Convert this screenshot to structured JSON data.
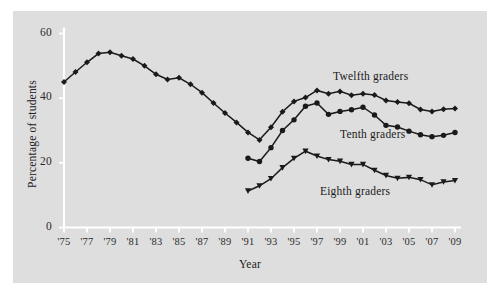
{
  "chart_data": {
    "type": "line",
    "title": "",
    "xlabel": "Year",
    "ylabel": "Percentage of students",
    "xlim": [
      1975,
      2009
    ],
    "ylim": [
      0,
      62
    ],
    "yticks": [
      0,
      20,
      40,
      60
    ],
    "ytick_labels": [
      "0",
      "20",
      "40",
      "60"
    ],
    "xticks": [
      1975,
      1977,
      1979,
      1981,
      1983,
      1985,
      1987,
      1989,
      1991,
      1993,
      1995,
      1997,
      1999,
      2001,
      2003,
      2005,
      2007,
      2009
    ],
    "xtick_labels": [
      "'75",
      "'77",
      "'79",
      "'81",
      "'83",
      "'85",
      "'87",
      "'89",
      "'91",
      "'93",
      "'95",
      "'97",
      "'99",
      "'01",
      "'03",
      "'05",
      "'07",
      "'09"
    ],
    "grid": false,
    "legend_position": "inline-annotations",
    "series": [
      {
        "name": "Twelfth graders",
        "marker": "diamond",
        "color": "#1a1a1a",
        "x": [
          1975,
          1976,
          1977,
          1978,
          1979,
          1980,
          1981,
          1982,
          1983,
          1984,
          1985,
          1986,
          1987,
          1988,
          1989,
          1990,
          1991,
          1992,
          1993,
          1994,
          1995,
          1996,
          1997,
          1998,
          1999,
          2000,
          2001,
          2002,
          2003,
          2004,
          2005,
          2006,
          2007,
          2008,
          2009
        ],
        "values": [
          45.0,
          48.1,
          51.1,
          53.8,
          54.2,
          53.1,
          52.1,
          50.0,
          47.4,
          45.8,
          46.3,
          44.3,
          41.7,
          38.5,
          35.4,
          32.5,
          29.4,
          27.1,
          31.0,
          35.8,
          39.0,
          40.2,
          42.4,
          41.4,
          42.1,
          40.9,
          41.4,
          41.0,
          39.3,
          38.8,
          38.4,
          36.5,
          35.9,
          36.6,
          36.8
        ]
      },
      {
        "name": "Tenth graders",
        "marker": "circle",
        "color": "#1a1a1a",
        "x": [
          1991,
          1992,
          1993,
          1994,
          1995,
          1996,
          1997,
          1998,
          1999,
          2000,
          2001,
          2002,
          2003,
          2004,
          2005,
          2006,
          2007,
          2008,
          2009
        ],
        "values": [
          21.4,
          20.4,
          24.7,
          30.0,
          33.3,
          37.5,
          38.5,
          35.0,
          35.9,
          36.4,
          37.2,
          34.8,
          31.6,
          31.1,
          29.8,
          28.7,
          28.1,
          28.5,
          29.4
        ]
      },
      {
        "name": "Eighth graders",
        "marker": "triangle",
        "color": "#1a1a1a",
        "x": [
          1991,
          1992,
          1993,
          1994,
          1995,
          1996,
          1997,
          1998,
          1999,
          2000,
          2001,
          2002,
          2003,
          2004,
          2005,
          2006,
          2007,
          2008,
          2009
        ],
        "values": [
          11.3,
          12.9,
          15.1,
          18.5,
          21.4,
          23.6,
          22.1,
          21.0,
          20.5,
          19.5,
          19.5,
          17.7,
          16.1,
          15.2,
          15.5,
          14.8,
          13.2,
          14.1,
          14.5
        ]
      }
    ],
    "annotations": [
      {
        "text": "Twelfth graders",
        "x_px": 333,
        "y_px": 70
      },
      {
        "text": "Tenth graders",
        "x_px": 340,
        "y_px": 128
      },
      {
        "text": "Eighth graders",
        "x_px": 320,
        "y_px": 185
      }
    ]
  }
}
